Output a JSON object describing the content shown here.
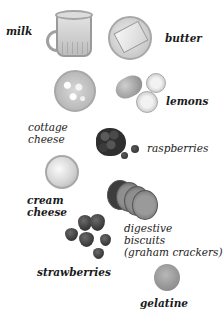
{
  "ingredients": [
    {
      "id": "milk",
      "label": "milk"
    },
    {
      "id": "butter",
      "label": "butter"
    },
    {
      "id": "cottage-cheese",
      "label_lines": [
        "cottage",
        "cheese"
      ]
    },
    {
      "id": "lemons",
      "label": "lemons"
    },
    {
      "id": "raspberries",
      "label": "raspberries"
    },
    {
      "id": "cream-cheese",
      "label_lines": [
        "cream",
        "cheese"
      ]
    },
    {
      "id": "digestive-biscuits",
      "label_lines": [
        "digestive",
        "biscuits",
        "(graham crackers)"
      ]
    },
    {
      "id": "strawberries",
      "label": "strawberries"
    },
    {
      "id": "gelatine",
      "label": "gelatine"
    }
  ]
}
